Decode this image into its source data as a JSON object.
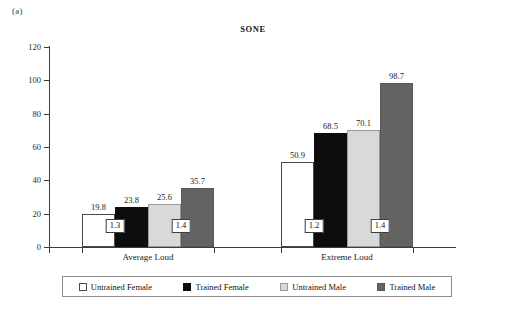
{
  "panel": {
    "label": "(a)"
  },
  "chart_data": {
    "type": "bar",
    "title": "SONE",
    "xlabel": "",
    "ylabel": "",
    "ylim": [
      0,
      120
    ],
    "yticks": [
      0,
      20,
      40,
      60,
      80,
      100,
      120
    ],
    "ytick_labels": [
      "0",
      "20",
      "40",
      "60",
      "80",
      "100",
      "120"
    ],
    "grid": false,
    "legend_position": "bottom",
    "categories": [
      "Average Loud",
      "Extreme Loud"
    ],
    "series": [
      {
        "name": "Untrained Female",
        "color": "#ffffff",
        "values": [
          19.8,
          50.9
        ],
        "labels": [
          "19.8",
          "50.9"
        ]
      },
      {
        "name": "Trained Female",
        "color": "#0d0d0d",
        "values": [
          23.8,
          68.5
        ],
        "labels": [
          "23.8",
          "68.5"
        ]
      },
      {
        "name": "Untrained Male",
        "color": "#d9d9d9",
        "values": [
          25.6,
          70.1
        ],
        "labels": [
          "25.6",
          "70.1"
        ]
      },
      {
        "name": "Trained Male",
        "color": "#636363",
        "values": [
          35.7,
          98.7
        ],
        "labels": [
          "35.7",
          "98.7"
        ]
      }
    ],
    "annotations": [
      {
        "text": "1.3",
        "group": "Average Loud",
        "between": [
          "Untrained Female",
          "Trained Female"
        ]
      },
      {
        "text": "1.4",
        "group": "Average Loud",
        "between": [
          "Untrained Male",
          "Trained Male"
        ]
      },
      {
        "text": "1.2",
        "group": "Extreme Loud",
        "between": [
          "Untrained Female",
          "Trained Female"
        ]
      },
      {
        "text": "1.4",
        "group": "Extreme Loud",
        "between": [
          "Untrained Male",
          "Trained Male"
        ]
      }
    ]
  },
  "legend": {
    "items": [
      {
        "label": "Untrained Female",
        "swatch": "c0"
      },
      {
        "label": "Trained Female",
        "swatch": "c1"
      },
      {
        "label": "Untrained Male",
        "swatch": "c2"
      },
      {
        "label": "Trained Male",
        "swatch": "c3"
      }
    ]
  }
}
